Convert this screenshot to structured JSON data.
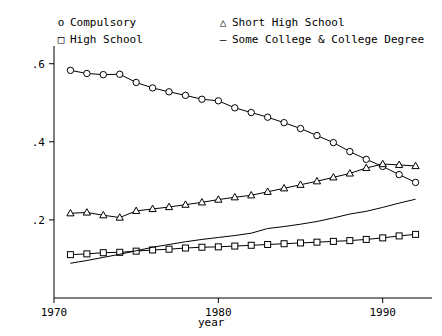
{
  "legend": {
    "left": [
      {
        "symbol": "o",
        "label": "Compulsory"
      },
      {
        "symbol": "□",
        "label": "High School"
      }
    ],
    "right": [
      {
        "symbol": "△",
        "label": "Short High School"
      },
      {
        "symbol": "–",
        "label": "Some College & College Degree"
      }
    ]
  },
  "chart_data": {
    "type": "line",
    "title": "",
    "xlabel": "year",
    "ylabel": "",
    "xlim": [
      1970,
      1993
    ],
    "ylim": [
      0.0,
      0.63
    ],
    "xticks": [
      1970,
      1980,
      1990
    ],
    "xtick_labels": [
      "1970",
      "1980",
      "1990"
    ],
    "yticks": [
      0.2,
      0.4,
      0.6
    ],
    "ytick_labels": [
      ".2",
      ".4",
      ".6"
    ],
    "grid": false,
    "legend_position": "top",
    "x": [
      1971,
      1972,
      1973,
      1974,
      1975,
      1976,
      1977,
      1978,
      1979,
      1980,
      1981,
      1982,
      1983,
      1984,
      1985,
      1986,
      1987,
      1988,
      1989,
      1990,
      1991,
      1992
    ],
    "series": [
      {
        "name": "Compulsory",
        "marker": "circle",
        "values": [
          0.583,
          0.575,
          0.572,
          0.573,
          0.552,
          0.538,
          0.528,
          0.519,
          0.509,
          0.505,
          0.487,
          0.475,
          0.463,
          0.449,
          0.434,
          0.416,
          0.398,
          0.375,
          0.355,
          0.337,
          0.316,
          0.296
        ]
      },
      {
        "name": "Short High School",
        "marker": "triangle",
        "values": [
          0.217,
          0.219,
          0.212,
          0.206,
          0.223,
          0.228,
          0.233,
          0.239,
          0.245,
          0.252,
          0.258,
          0.263,
          0.272,
          0.281,
          0.29,
          0.299,
          0.309,
          0.319,
          0.333,
          0.343,
          0.341,
          0.338
        ]
      },
      {
        "name": "High School",
        "marker": "square",
        "values": [
          0.111,
          0.113,
          0.116,
          0.117,
          0.12,
          0.123,
          0.125,
          0.128,
          0.13,
          0.131,
          0.133,
          0.135,
          0.137,
          0.139,
          0.141,
          0.143,
          0.145,
          0.147,
          0.15,
          0.154,
          0.159,
          0.163
        ]
      },
      {
        "name": "Some College & College Degree",
        "marker": "none",
        "values": [
          0.089,
          0.096,
          0.104,
          0.112,
          0.121,
          0.13,
          0.137,
          0.144,
          0.15,
          0.155,
          0.16,
          0.166,
          0.178,
          0.183,
          0.189,
          0.196,
          0.205,
          0.215,
          0.222,
          0.232,
          0.243,
          0.253
        ]
      }
    ]
  }
}
